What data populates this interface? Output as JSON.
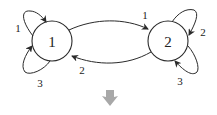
{
  "diagram": {
    "type": "state-transition-graph",
    "nodes": [
      {
        "id": "1",
        "label": "1"
      },
      {
        "id": "2",
        "label": "2"
      }
    ],
    "edges": [
      {
        "from": "1",
        "to": "2",
        "label": "1"
      },
      {
        "from": "2",
        "to": "1",
        "label": "2"
      },
      {
        "from": "1",
        "to": "1",
        "label": "1",
        "position": "upper-left"
      },
      {
        "from": "1",
        "to": "1",
        "label": "3",
        "position": "lower-left"
      },
      {
        "from": "2",
        "to": "2",
        "label": "2",
        "position": "upper-right"
      },
      {
        "from": "2",
        "to": "2",
        "label": "3",
        "position": "lower-right"
      }
    ],
    "down_arrow": {
      "icon": "down-arrow-icon",
      "color": "#a0a0a0"
    },
    "colors": {
      "stroke": "#2a2a2a",
      "text": "#222222"
    }
  }
}
